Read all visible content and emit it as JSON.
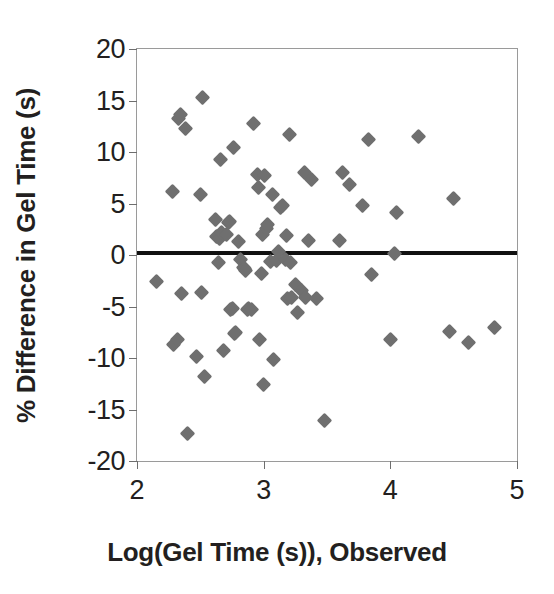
{
  "chart_data": {
    "type": "scatter",
    "title": "",
    "xlabel": "Log(Gel Time (s)), Observed",
    "ylabel": "% Difference in Gel Time (s)",
    "xlim": [
      2,
      5
    ],
    "ylim": [
      -20,
      20
    ],
    "xticks": [
      2,
      3,
      4,
      5
    ],
    "yticks": [
      20,
      15,
      10,
      5,
      0,
      -5,
      -10,
      -15,
      -20
    ],
    "xtick_labels": [
      "2",
      "3",
      "4",
      "5"
    ],
    "ytick_labels": [
      "20",
      "15",
      "10",
      "5",
      "0",
      "-5",
      "-10",
      "-15",
      "-20"
    ],
    "grid": false,
    "legend": null,
    "marker_color": "#6f6f6f",
    "marker_shape": "diamond",
    "reference_line": {
      "orientation": "horizontal",
      "y": 0.2,
      "color": "#111111",
      "label": ""
    },
    "series": [
      {
        "name": "Gel time residuals",
        "points": [
          [
            2.15,
            -2.6
          ],
          [
            2.28,
            6.2
          ],
          [
            2.29,
            -8.7
          ],
          [
            2.32,
            -8.2
          ],
          [
            2.33,
            13.3
          ],
          [
            2.34,
            13.6
          ],
          [
            2.35,
            -3.7
          ],
          [
            2.38,
            12.3
          ],
          [
            2.4,
            -17.3
          ],
          [
            2.47,
            -9.9
          ],
          [
            2.5,
            5.9
          ],
          [
            2.51,
            -3.6
          ],
          [
            2.52,
            15.3
          ],
          [
            2.53,
            -11.8
          ],
          [
            2.62,
            3.4
          ],
          [
            2.63,
            1.8
          ],
          [
            2.64,
            -0.7
          ],
          [
            2.65,
            1.6
          ],
          [
            2.66,
            9.3
          ],
          [
            2.67,
            2.2
          ],
          [
            2.68,
            -9.3
          ],
          [
            2.71,
            2.0
          ],
          [
            2.72,
            3.2
          ],
          [
            2.73,
            3.3
          ],
          [
            2.74,
            -5.3
          ],
          [
            2.75,
            -5.2
          ],
          [
            2.76,
            10.4
          ],
          [
            2.77,
            -7.6
          ],
          [
            2.78,
            -7.5
          ],
          [
            2.8,
            1.3
          ],
          [
            2.82,
            -0.4
          ],
          [
            2.84,
            -1.2
          ],
          [
            2.85,
            -1.3
          ],
          [
            2.86,
            -1.5
          ],
          [
            2.87,
            -5.3
          ],
          [
            2.88,
            -5.2
          ],
          [
            2.9,
            -5.3
          ],
          [
            2.92,
            12.8
          ],
          [
            2.95,
            7.8
          ],
          [
            2.96,
            6.6
          ],
          [
            2.97,
            -8.2
          ],
          [
            2.98,
            -1.8
          ],
          [
            2.99,
            2.0
          ],
          [
            3.0,
            -12.6
          ],
          [
            3.01,
            7.7
          ],
          [
            3.02,
            2.6
          ],
          [
            3.03,
            3.0
          ],
          [
            3.05,
            -0.6
          ],
          [
            3.07,
            5.9
          ],
          [
            3.08,
            -10.1
          ],
          [
            3.1,
            -0.5
          ],
          [
            3.12,
            0.3
          ],
          [
            3.13,
            4.6
          ],
          [
            3.15,
            4.8
          ],
          [
            3.17,
            -0.4
          ],
          [
            3.18,
            1.9
          ],
          [
            3.19,
            -4.2
          ],
          [
            3.2,
            11.7
          ],
          [
            3.21,
            -0.7
          ],
          [
            3.22,
            -4.1
          ],
          [
            3.25,
            -2.9
          ],
          [
            3.27,
            -5.6
          ],
          [
            3.3,
            -3.4
          ],
          [
            3.32,
            8.0
          ],
          [
            3.33,
            -4.1
          ],
          [
            3.35,
            1.4
          ],
          [
            3.38,
            7.3
          ],
          [
            3.42,
            -4.2
          ],
          [
            3.48,
            -16.1
          ],
          [
            3.6,
            1.4
          ],
          [
            3.62,
            8.0
          ],
          [
            3.68,
            6.8
          ],
          [
            3.78,
            4.8
          ],
          [
            3.83,
            11.2
          ],
          [
            3.85,
            -1.9
          ],
          [
            4.0,
            -8.2
          ],
          [
            4.03,
            0.1
          ],
          [
            4.05,
            4.1
          ],
          [
            4.22,
            11.5
          ],
          [
            4.47,
            -7.4
          ],
          [
            4.5,
            5.5
          ],
          [
            4.62,
            -8.5
          ],
          [
            4.82,
            -7.0
          ]
        ]
      }
    ]
  }
}
